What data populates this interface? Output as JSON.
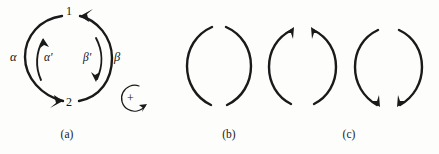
{
  "figure": {
    "background_color": "#fdfdfc",
    "ink_color": "#1a1a1a",
    "panels": [
      {
        "caption": "(a)",
        "caption_x": 65,
        "caption_y": 130,
        "description": "broken circular contour split into two arcs meeting at nodes 1 and 2, with inner companion arcs",
        "node_labels": [
          {
            "text": "1",
            "position": "top",
            "x": 69,
            "y": 8
          },
          {
            "text": "2",
            "position": "bottom",
            "x": 69,
            "y": 98
          }
        ],
        "path_labels": [
          {
            "text": "α",
            "meaning": "alpha",
            "side": "outer-left",
            "x": 13,
            "y": 55
          },
          {
            "text": "α′",
            "meaning": "alpha-prime",
            "side": "inner-left",
            "x": 45,
            "y": 56
          },
          {
            "text": "β′",
            "meaning": "beta-prime",
            "side": "inner-right",
            "x": 85,
            "y": 56
          },
          {
            "text": "β",
            "meaning": "beta",
            "side": "outer-right",
            "x": 114,
            "y": 55
          }
        ],
        "orientation_marker": {
          "symbol": "+",
          "meaning": "positive orientation, counterclockwise circular arrow",
          "x": 129,
          "y": 98
        },
        "arrowheads": [
          {
            "on": "outer-right-arc",
            "points_to": "node-1",
            "direction": "up-left"
          },
          {
            "on": "outer-left-arc",
            "points_to": "node-2",
            "direction": "down-right"
          },
          {
            "on": "inner-left-arc",
            "direction": "up"
          },
          {
            "on": "inner-right-arc",
            "direction": "down"
          }
        ]
      },
      {
        "caption": "(b)",
        "caption_x": 228,
        "caption_y": 130,
        "description": "broken circle of two arcs with gaps at top and bottom, no arrowheads",
        "node_labels": [],
        "path_labels": [],
        "arrowheads": []
      },
      {
        "caption": "",
        "caption_x": 0,
        "caption_y": 0,
        "description": "broken circle of two arcs with both arrowheads at the top pointing up and inward",
        "node_labels": [],
        "path_labels": [],
        "arrowheads": [
          {
            "on": "left-arc",
            "direction": "up-right",
            "position": "top"
          },
          {
            "on": "right-arc",
            "direction": "up-left",
            "position": "top"
          }
        ]
      },
      {
        "caption": "(c)",
        "caption_x": 348,
        "caption_y": 130,
        "description": "broken circle of two arcs with both arrowheads at the bottom pointing down and inward",
        "node_labels": [],
        "path_labels": [],
        "arrowheads": [
          {
            "on": "left-arc",
            "direction": "down-right",
            "position": "bottom"
          },
          {
            "on": "right-arc",
            "direction": "down-left",
            "position": "bottom"
          }
        ]
      }
    ]
  }
}
